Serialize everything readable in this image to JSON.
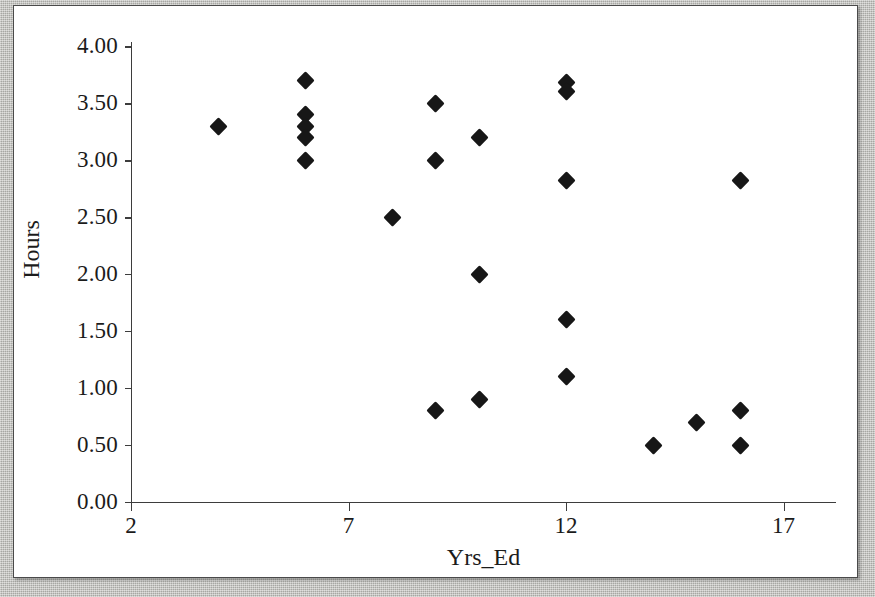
{
  "figure": {
    "kind": "scatterplot",
    "marker_color": "#171717",
    "axis_color": "#3d3d3d",
    "background_color": "#ffffff"
  },
  "chart_data": {
    "type": "scatter",
    "title": "",
    "xlabel": "Yrs_Ed",
    "ylabel": "Hours",
    "xlim": [
      2,
      17.8
    ],
    "ylim": [
      0.0,
      4.0
    ],
    "grid": false,
    "legend": null,
    "x_ticks": [
      2,
      7,
      12,
      17
    ],
    "x_tick_labels": [
      "2",
      "7",
      "12",
      "17"
    ],
    "y_ticks": [
      0.0,
      0.5,
      1.0,
      1.5,
      2.0,
      2.5,
      3.0,
      3.5,
      4.0
    ],
    "y_tick_labels": [
      "0.00",
      "0.50",
      "1.00",
      "1.50",
      "2.00",
      "2.50",
      "3.00",
      "3.50",
      "4.00"
    ],
    "marker": "diamond",
    "points": [
      {
        "x": 4.0,
        "y": 3.3
      },
      {
        "x": 6.0,
        "y": 3.7
      },
      {
        "x": 6.0,
        "y": 3.4
      },
      {
        "x": 6.0,
        "y": 3.3
      },
      {
        "x": 6.0,
        "y": 3.2
      },
      {
        "x": 6.0,
        "y": 3.0
      },
      {
        "x": 8.0,
        "y": 2.5
      },
      {
        "x": 9.0,
        "y": 3.5
      },
      {
        "x": 9.0,
        "y": 3.0
      },
      {
        "x": 9.0,
        "y": 0.8
      },
      {
        "x": 10.0,
        "y": 3.2
      },
      {
        "x": 10.0,
        "y": 2.0
      },
      {
        "x": 10.0,
        "y": 0.9
      },
      {
        "x": 12.0,
        "y": 3.68
      },
      {
        "x": 12.0,
        "y": 3.6
      },
      {
        "x": 12.0,
        "y": 2.82
      },
      {
        "x": 12.0,
        "y": 1.6
      },
      {
        "x": 12.0,
        "y": 1.1
      },
      {
        "x": 14.0,
        "y": 0.5
      },
      {
        "x": 15.0,
        "y": 0.7
      },
      {
        "x": 16.0,
        "y": 2.82
      },
      {
        "x": 16.0,
        "y": 0.8
      },
      {
        "x": 16.0,
        "y": 0.5
      }
    ]
  }
}
